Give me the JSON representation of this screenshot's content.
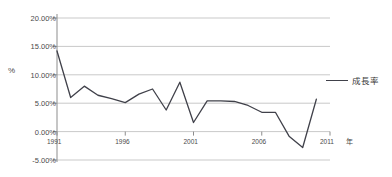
{
  "chart_data": {
    "type": "line",
    "title": "",
    "xlabel": "年",
    "ylabel": "%",
    "grid": true,
    "legend_position": "right",
    "xlim": [
      1991,
      2011
    ],
    "ylim": [
      -5,
      20
    ],
    "x_ticks": [
      "1991",
      "1996",
      "2001",
      "2006",
      "2011"
    ],
    "x_tick_values": [
      1991,
      1996,
      2001,
      2006,
      2011
    ],
    "y_ticks": [
      "20.00%",
      "15.00%",
      "10.00%",
      "5.00%",
      "0.00%",
      "-5.00%"
    ],
    "y_tick_values": [
      20,
      15,
      10,
      5,
      0,
      -5
    ],
    "series": [
      {
        "name": "成長率",
        "color": "#40414a",
        "x": [
          1991,
          1992,
          1993,
          1994,
          1995,
          1996,
          1997,
          1998,
          1999,
          2000,
          2001,
          2002,
          2003,
          2004,
          2005,
          2006,
          2007,
          2008,
          2009,
          2010
        ],
        "values": [
          14.2,
          6.0,
          8.0,
          6.4,
          5.8,
          5.1,
          6.6,
          7.5,
          3.8,
          8.7,
          1.6,
          5.4,
          5.4,
          5.3,
          4.6,
          3.4,
          3.4,
          -0.8,
          -2.8,
          5.7
        ]
      }
    ]
  },
  "axis": {
    "y_title": "%",
    "x_unit": "年",
    "x_unit_year": "2011"
  },
  "legend": {
    "entries": [
      {
        "label": "成長率"
      }
    ]
  }
}
